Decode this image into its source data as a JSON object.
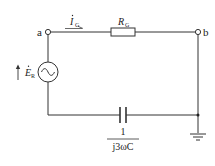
{
  "diagram": {
    "type": "circuit",
    "nodes": {
      "a": {
        "label": "a"
      },
      "b": {
        "label": "b"
      }
    },
    "current": {
      "symbol": "I",
      "subscript": "G",
      "phasor": true
    },
    "resistor": {
      "symbol": "R",
      "subscript": "G"
    },
    "source": {
      "symbol": "E",
      "subscript": "R",
      "phasor": true,
      "type": "ac-voltage-source"
    },
    "capacitor": {
      "numerator": "1",
      "denominator": "j3ωC"
    },
    "ground": {
      "present": true
    }
  }
}
